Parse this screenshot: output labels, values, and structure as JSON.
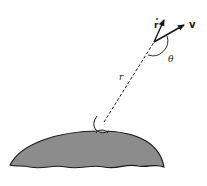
{
  "diagram": {
    "title": "",
    "labels": {
      "r_dot": "r",
      "velocity": "v",
      "angle": "θ",
      "radius": "r"
    },
    "colors": {
      "planet_fill": "#8c8c8c",
      "stroke": "#1a1a1a",
      "background": "#ffffff"
    },
    "elements": [
      "planet-body",
      "observer-on-surface",
      "radius-dashed-line",
      "r-dot-vector",
      "velocity-vector",
      "angle-theta-arc"
    ]
  }
}
